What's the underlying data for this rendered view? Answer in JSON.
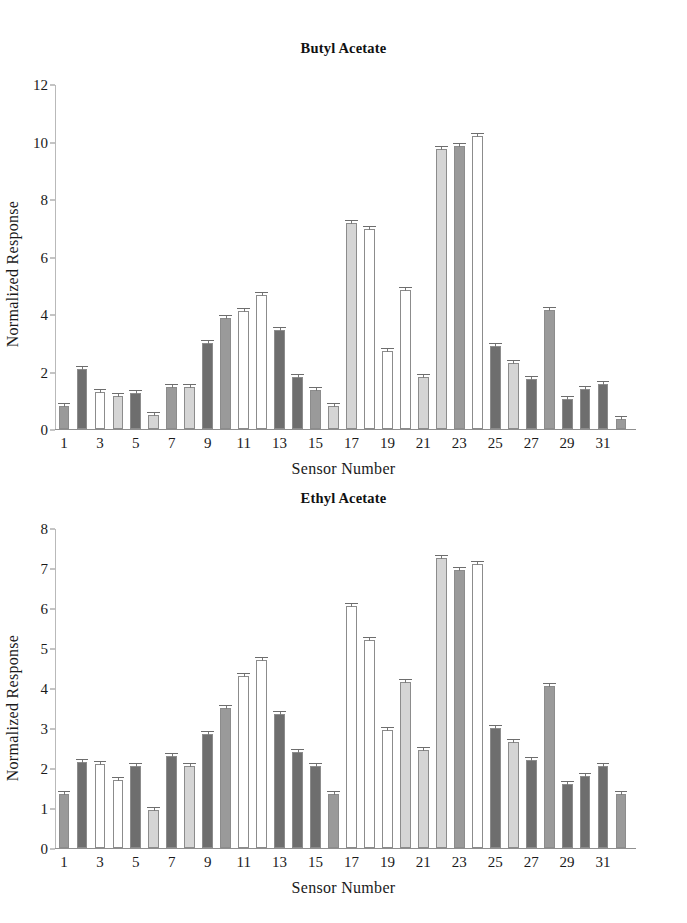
{
  "figures": [
    {
      "id": "butyl",
      "title": "Butyl Acetate",
      "ylabel": "Normalized Response",
      "xlabel": "Sensor Number"
    },
    {
      "id": "ethyl",
      "title": "Ethyl Acetate",
      "ylabel": "Normalized Response",
      "xlabel": "Sensor Number"
    }
  ],
  "palette": {
    "medium_gray": "#9a9a9a",
    "dark_gray": "#6e6e6e",
    "white": "#ffffff",
    "light_gray": "#d5d5d5",
    "bar_outline": "#8c8c8c",
    "axis": "#8f8f8f",
    "text": "#1a1a1a"
  },
  "chart_data": [
    {
      "type": "bar",
      "title": "Butyl Acetate",
      "xlabel": "Sensor Number",
      "ylabel": "Normalized Response",
      "ylim": [
        0,
        12
      ],
      "yticks": [
        0,
        2,
        4,
        6,
        8,
        10,
        12
      ],
      "xticks": [
        1,
        3,
        5,
        7,
        9,
        11,
        13,
        15,
        17,
        19,
        21,
        23,
        25,
        27,
        29,
        31
      ],
      "grid": false,
      "legend": "none",
      "errorbars": true,
      "categories": [
        1,
        2,
        3,
        4,
        5,
        6,
        7,
        8,
        9,
        10,
        11,
        12,
        13,
        14,
        15,
        16,
        17,
        18,
        19,
        20,
        21,
        22,
        23,
        24,
        25,
        26,
        27,
        28,
        29,
        30,
        31,
        32
      ],
      "values": [
        0.8,
        2.1,
        1.3,
        1.15,
        1.25,
        0.5,
        1.45,
        1.45,
        3.0,
        3.85,
        4.1,
        4.65,
        3.45,
        1.8,
        1.35,
        0.8,
        7.15,
        6.95,
        2.7,
        4.85,
        1.8,
        9.75,
        9.85,
        10.2,
        2.9,
        2.3,
        1.75,
        4.15,
        1.05,
        1.4,
        1.55,
        0.35
      ],
      "bar_colors": [
        "medium_gray",
        "dark_gray",
        "white",
        "light_gray",
        "dark_gray",
        "light_gray",
        "medium_gray",
        "light_gray",
        "dark_gray",
        "medium_gray",
        "white",
        "white",
        "dark_gray",
        "dark_gray",
        "medium_gray",
        "light_gray",
        "light_gray",
        "white",
        "white",
        "white",
        "light_gray",
        "light_gray",
        "medium_gray",
        "white",
        "dark_gray",
        "light_gray",
        "dark_gray",
        "medium_gray",
        "dark_gray",
        "dark_gray",
        "dark_gray",
        "medium_gray"
      ]
    },
    {
      "type": "bar",
      "title": "Ethyl Acetate",
      "xlabel": "Sensor Number",
      "ylabel": "Normalized Response",
      "ylim": [
        0,
        8
      ],
      "yticks": [
        0,
        1,
        2,
        3,
        4,
        5,
        6,
        7,
        8
      ],
      "xticks": [
        1,
        3,
        5,
        7,
        9,
        11,
        13,
        15,
        17,
        19,
        21,
        23,
        25,
        27,
        29,
        31
      ],
      "grid": false,
      "legend": "none",
      "errorbars": true,
      "categories": [
        1,
        2,
        3,
        4,
        5,
        6,
        7,
        8,
        9,
        10,
        11,
        12,
        13,
        14,
        15,
        16,
        17,
        18,
        19,
        20,
        21,
        22,
        23,
        24,
        25,
        26,
        27,
        28,
        29,
        30,
        31,
        32
      ],
      "values": [
        1.35,
        2.15,
        2.1,
        1.7,
        2.05,
        0.95,
        2.3,
        2.05,
        2.85,
        3.5,
        4.3,
        4.7,
        3.35,
        2.4,
        2.05,
        1.35,
        6.05,
        5.2,
        2.95,
        4.15,
        2.45,
        7.25,
        6.95,
        7.1,
        3.0,
        2.65,
        2.2,
        4.05,
        1.6,
        1.8,
        2.05,
        1.35
      ],
      "bar_colors": [
        "medium_gray",
        "dark_gray",
        "white",
        "white",
        "dark_gray",
        "light_gray",
        "dark_gray",
        "light_gray",
        "dark_gray",
        "medium_gray",
        "white",
        "white",
        "dark_gray",
        "dark_gray",
        "dark_gray",
        "medium_gray",
        "white",
        "white",
        "white",
        "light_gray",
        "light_gray",
        "light_gray",
        "medium_gray",
        "white",
        "dark_gray",
        "light_gray",
        "dark_gray",
        "medium_gray",
        "dark_gray",
        "dark_gray",
        "dark_gray",
        "medium_gray"
      ]
    }
  ]
}
